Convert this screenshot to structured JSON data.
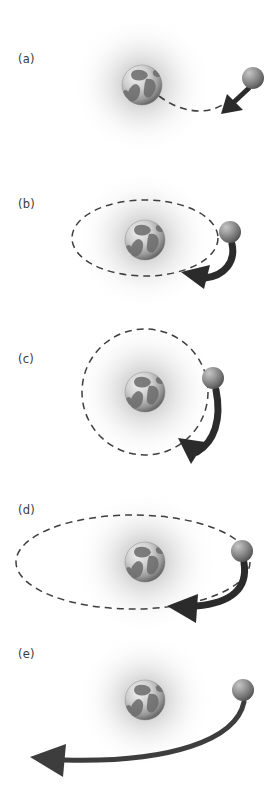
{
  "figure": {
    "background_color": "#ffffff",
    "width": 274,
    "height": 803,
    "panel_count": 5
  },
  "colors": {
    "panel_label": "#3a3a3a",
    "dashed_orbit": "#3f3f3f",
    "arrow_dark": "#2b2b2b",
    "arrow_mid": "#4a4a4a",
    "ball_light": "#bdbdbd",
    "ball_mid": "#8a8a8a",
    "ball_dark": "#5c5c5c",
    "glow_inner": "#c9c9c9",
    "glow_outer": "#ffffff",
    "earth_ocean": "#d8d8d8",
    "earth_land": "#6e6e6e",
    "earth_shadow": "#4f4f4f"
  },
  "panels": [
    {
      "id": "a",
      "label": "(a)",
      "label_x": 18,
      "label_y": 60,
      "caption": "suborbital-impact-trajectory",
      "earth": {
        "cx": 142,
        "cy": 85,
        "r": 20
      },
      "glow": {
        "cx": 142,
        "cy": 85,
        "r": 70
      },
      "orbit": {
        "type": "dashed-curve",
        "closed": false
      },
      "ball": {
        "cx": 253,
        "cy": 78,
        "r": 11
      },
      "arrow": {
        "style": "short-thick",
        "direction": "down-left",
        "length": "short"
      }
    },
    {
      "id": "b",
      "label": "(b)",
      "label_x": 18,
      "label_y": 205,
      "caption": "small-elliptical-orbit",
      "earth": {
        "cx": 145,
        "cy": 240,
        "r": 20
      },
      "glow": {
        "cx": 145,
        "cy": 240,
        "r": 70
      },
      "orbit": {
        "type": "ellipse",
        "closed": true,
        "cx": 145,
        "cy": 238,
        "rx": 73,
        "ry": 38
      },
      "ball": {
        "cx": 230,
        "cy": 232,
        "r": 11
      },
      "arrow": {
        "style": "thick-curved",
        "direction": "counter-clockwise",
        "length": "medium"
      }
    },
    {
      "id": "c",
      "label": "(c)",
      "label_x": 18,
      "label_y": 355,
      "caption": "circular-orbit",
      "earth": {
        "cx": 145,
        "cy": 392,
        "r": 20
      },
      "glow": {
        "cx": 145,
        "cy": 392,
        "r": 72
      },
      "orbit": {
        "type": "circle",
        "closed": true,
        "cx": 145,
        "cy": 392,
        "rx": 63,
        "ry": 63
      },
      "ball": {
        "cx": 213,
        "cy": 378,
        "r": 11
      },
      "arrow": {
        "style": "thick-curved",
        "direction": "counter-clockwise",
        "length": "medium"
      }
    },
    {
      "id": "d",
      "label": "(d)",
      "label_x": 18,
      "label_y": 510,
      "caption": "eccentric-elliptical-orbit",
      "earth": {
        "cx": 145,
        "cy": 562,
        "r": 20
      },
      "glow": {
        "cx": 145,
        "cy": 562,
        "r": 72
      },
      "orbit": {
        "type": "ellipse",
        "closed": true,
        "cx": 133,
        "cy": 562,
        "rx": 117,
        "ry": 47
      },
      "ball": {
        "cx": 242,
        "cy": 551,
        "r": 11
      },
      "arrow": {
        "style": "thick-curved",
        "direction": "counter-clockwise",
        "length": "long"
      }
    },
    {
      "id": "e",
      "label": "(e)",
      "label_x": 18,
      "label_y": 655,
      "caption": "escape-trajectory",
      "earth": {
        "cx": 145,
        "cy": 700,
        "r": 20
      },
      "glow": {
        "cx": 145,
        "cy": 700,
        "r": 68
      },
      "orbit": {
        "type": "none",
        "closed": false
      },
      "ball": {
        "cx": 243,
        "cy": 690,
        "r": 11
      },
      "arrow": {
        "style": "long-sweep",
        "direction": "left-escape",
        "length": "full-width"
      }
    }
  ]
}
